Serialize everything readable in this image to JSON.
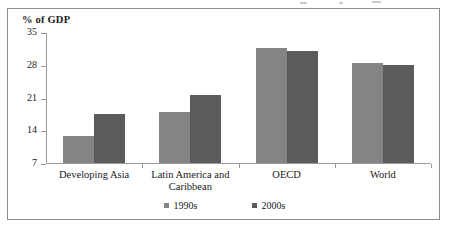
{
  "figure": {
    "frame_border_color": "#8d8d8d",
    "background": "#ffffff"
  },
  "chart_data": {
    "type": "bar",
    "title": "",
    "xlabel": "",
    "ylabel": "% of GDP",
    "ylim": [
      7,
      35
    ],
    "yticks": [
      35,
      28,
      21,
      14,
      7
    ],
    "grid": false,
    "legend_position": "bottom-center",
    "categories": [
      "Developing Asia",
      "Latin America and\nCaribbean",
      "OECD",
      "World"
    ],
    "series": [
      {
        "name": "1990s",
        "color": "#848484",
        "values": [
          12.7,
          17.9,
          31.5,
          28.4
        ]
      },
      {
        "name": "2000s",
        "color": "#5b5b5b",
        "values": [
          17.5,
          21.5,
          30.9,
          28.0
        ]
      }
    ]
  },
  "legend": {
    "items": [
      {
        "label": "1990s",
        "color": "#848484"
      },
      {
        "label": "2000s",
        "color": "#5b5b5b"
      }
    ]
  }
}
